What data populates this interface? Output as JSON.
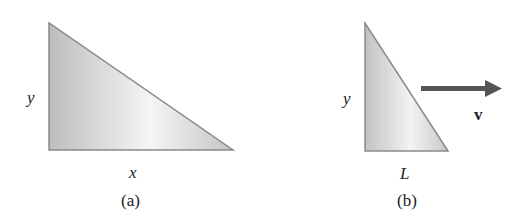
{
  "figure": {
    "panel_a": {
      "caption": "(a)",
      "vertical_label": "y",
      "horizontal_label": "x",
      "triangle": {
        "top": [
          49,
          23
        ],
        "bottom_left": [
          49,
          150
        ],
        "bottom_right": [
          233,
          150
        ]
      }
    },
    "panel_b": {
      "caption": "(b)",
      "vertical_label": "y",
      "horizontal_label": "L",
      "velocity_label": "v",
      "triangle": {
        "top": [
          365,
          23
        ],
        "bottom_left": [
          365,
          151
        ],
        "bottom_right": [
          448,
          151
        ]
      }
    },
    "colors": {
      "fill_dark": "#b8b8b8",
      "fill_light": "#f4f4f4",
      "edge": "#8a8a8a",
      "arrow": "#555555"
    }
  }
}
